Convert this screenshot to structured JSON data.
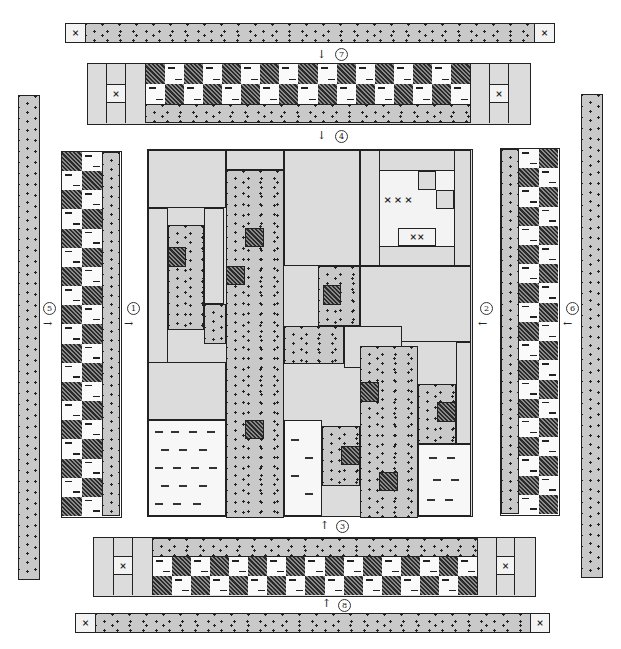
{
  "diagram": {
    "step_labels": [
      "1",
      "2",
      "3",
      "4",
      "5",
      "6",
      "7",
      "8"
    ],
    "assembly_steps": [
      {
        "id": 1,
        "label": "1",
        "direction": "right",
        "piece": "left checkerboard border"
      },
      {
        "id": 2,
        "label": "2",
        "direction": "left",
        "piece": "right checkerboard border"
      },
      {
        "id": 3,
        "label": "3",
        "direction": "up",
        "piece": "bottom checkerboard border"
      },
      {
        "id": 4,
        "label": "4",
        "direction": "down",
        "piece": "top checkerboard border"
      },
      {
        "id": 5,
        "label": "5",
        "direction": "right",
        "piece": "left outer dotted border"
      },
      {
        "id": 6,
        "label": "6",
        "direction": "left",
        "piece": "right outer dotted border"
      },
      {
        "id": 7,
        "label": "7",
        "direction": "down",
        "piece": "top outer dotted border with corner squares"
      },
      {
        "id": 8,
        "label": "8",
        "direction": "up",
        "piece": "bottom outer dotted border with corner squares"
      }
    ],
    "legend_fabrics": {
      "dotted": "#c9c9c9",
      "light": "#dcdcdc",
      "hatched": "#555555",
      "dashed_white": "#f7f7f7",
      "cross": "#f3f3f3"
    },
    "corner_mark": "×",
    "caption": "(caption truncated at bottom edge)"
  }
}
